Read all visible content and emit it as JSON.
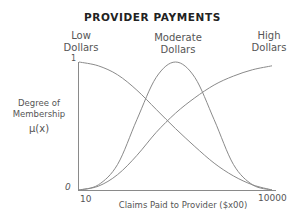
{
  "chart_data": {
    "type": "line",
    "title": "PROVIDER PAYMENTS",
    "xlabel": "Claims Paid to Provider ($x00)",
    "ylabel": "Degree of Membership μ(x)",
    "x_tick_labels": [
      "10",
      "10000"
    ],
    "y_tick_labels": [
      "0",
      "1"
    ],
    "ylim": [
      0,
      1
    ],
    "xlim": [
      10,
      10000
    ],
    "grid": false,
    "legend_position": "above curves",
    "x": [
      0,
      0.1,
      0.2,
      0.3,
      0.4,
      0.5,
      0.6,
      0.7,
      0.8,
      0.9,
      1.0
    ],
    "series": [
      {
        "name": "Low Dollars",
        "values": [
          1.0,
          0.97,
          0.9,
          0.78,
          0.63,
          0.48,
          0.34,
          0.21,
          0.11,
          0.04,
          0.0
        ]
      },
      {
        "name": "Moderate Dollars",
        "values": [
          0.0,
          0.04,
          0.2,
          0.55,
          0.88,
          1.0,
          0.88,
          0.55,
          0.2,
          0.04,
          0.0
        ]
      },
      {
        "name": "High Dollars",
        "values": [
          0.0,
          0.03,
          0.12,
          0.27,
          0.45,
          0.6,
          0.72,
          0.82,
          0.89,
          0.94,
          0.97
        ]
      }
    ]
  },
  "labels": {
    "title": "PROVIDER PAYMENTS",
    "low": [
      "Low",
      "Dollars"
    ],
    "moderate": [
      "Moderate",
      "Dollars"
    ],
    "high": [
      "High",
      "Dollars"
    ],
    "ylabel_lines": [
      "Degree of",
      "Membership",
      "μ(x)"
    ],
    "y_one": "1",
    "y_zero": "0",
    "x_min": "10",
    "x_max": "10000",
    "xlabel": "Claims Paid to Provider ($x00)"
  }
}
